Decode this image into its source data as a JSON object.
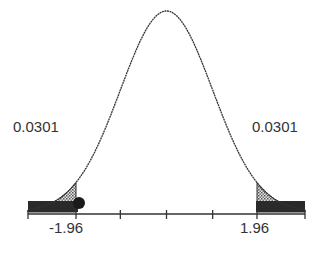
{
  "chart_data": {
    "type": "area",
    "title": "",
    "xlabel": "",
    "ylabel": "",
    "xlim": [
      -3,
      3
    ],
    "critical_values": [
      -1.96,
      1.96
    ],
    "tick_labels": [
      "-1.96",
      "1.96"
    ],
    "tail_areas": [
      {
        "side": "left",
        "label": "0.0301",
        "from": -3,
        "to": -1.96
      },
      {
        "side": "right",
        "label": "0.0301",
        "from": 1.96,
        "to": 3
      }
    ],
    "marker": {
      "x": -1.96,
      "shape": "dot"
    },
    "grid": false,
    "legend": null
  },
  "labels": {
    "left_tail": "0.0301",
    "right_tail": "0.0301",
    "left_crit": "-1.96",
    "right_crit": "1.96"
  }
}
